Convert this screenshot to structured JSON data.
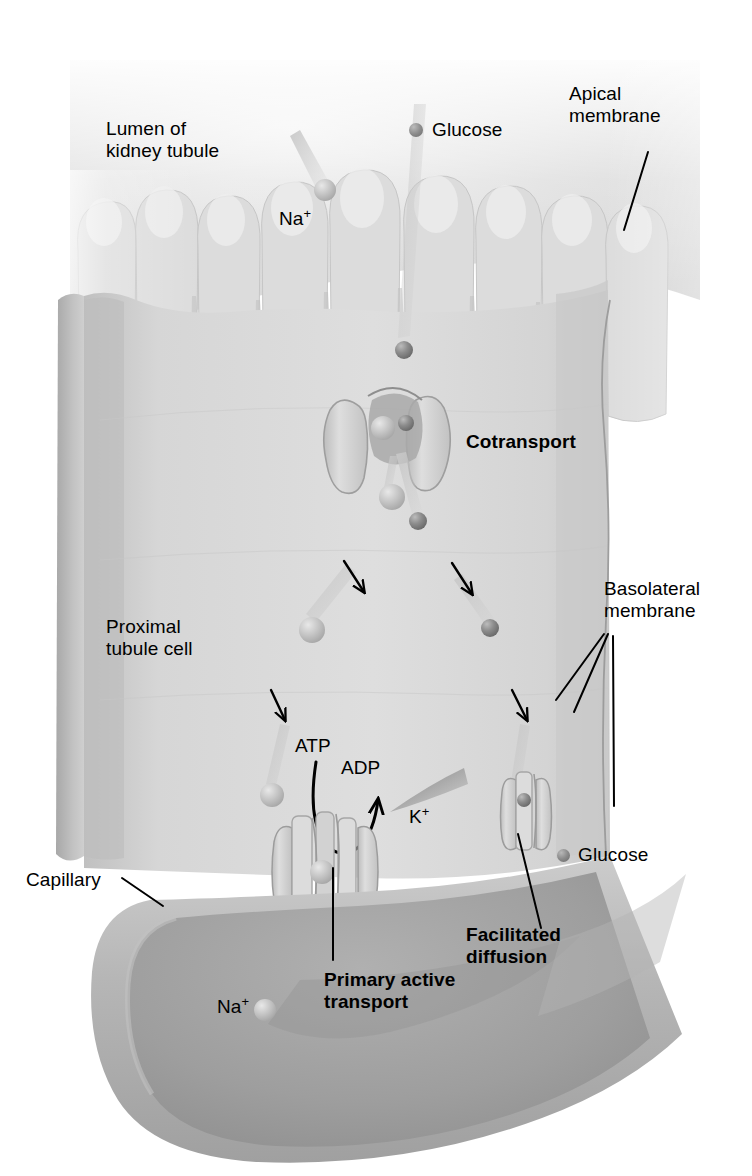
{
  "figure": {
    "domain": "biology-diagram"
  },
  "labels": {
    "lumen": "Lumen of\nkidney tubule",
    "na_lumen": "Na",
    "na_sup": "+",
    "glucose_top": "Glucose",
    "apical_membrane": "Apical\nmembrane",
    "cotransport": "Cotransport",
    "proximal_cell": "Proximal\ntubule cell",
    "basolateral_membrane": "Basolateral\nmembrane",
    "atp": "ATP",
    "adp": "ADP",
    "k_ion": "K",
    "k_sup": "+",
    "capillary": "Capillary",
    "glucose_bottom": "Glucose",
    "facilitated_diffusion": "Facilitated\ndiffusion",
    "primary_active_transport": "Primary active\ntransport",
    "na_capillary": "Na",
    "na_cap_sup": "+"
  },
  "colors": {
    "background": "#ffffff",
    "text": "#000000",
    "lumen_fill": "#d8d8d8",
    "microvilli_fill": "#dcdcdc",
    "cell_fill": "#d2d2d2",
    "cell_face_light": "#dcdcdc",
    "cell_side_dark": "#b4b4b4",
    "capillary_wall": "#b9b9b9",
    "capillary_lumen": "#a2a2a2",
    "protein_fill": "#c8c8c8",
    "na_particle": "#bdbdbd",
    "glucose_particle": "#8a8a8a",
    "arrow_stroke": "#000000",
    "membrane_line": "#9a9a9a"
  },
  "particles": {
    "glucose_marker_top": {
      "x": 416,
      "y": 130,
      "r": 7
    },
    "glucose_marker_bottom": {
      "x": 563,
      "y": 855,
      "r": 6
    },
    "na_in_microvillus": {
      "x": 325,
      "y": 190,
      "r": 11
    },
    "glucose_entering": {
      "x": 404,
      "y": 350,
      "r": 9
    },
    "na_in_cotransporter": {
      "x": 383,
      "y": 428,
      "r": 12
    },
    "glucose_in_cotransporter": {
      "x": 405,
      "y": 423,
      "r": 8
    },
    "na_below_cotransporter": {
      "x": 392,
      "y": 497,
      "r": 13
    },
    "glucose_below_cotransporter": {
      "x": 417,
      "y": 521,
      "r": 9
    },
    "na_midcell": {
      "x": 312,
      "y": 630,
      "r": 13
    },
    "glucose_midcell": {
      "x": 490,
      "y": 628,
      "r": 9
    },
    "na_lower": {
      "x": 272,
      "y": 795,
      "r": 12
    },
    "na_in_pump": {
      "x": 322,
      "y": 872,
      "r": 12
    },
    "na_in_capillary": {
      "x": 265,
      "y": 1010,
      "r": 11
    }
  },
  "arrows": {
    "transport_arrows": [
      {
        "name": "na-down-left-upper",
        "x1": 344,
        "y1": 561,
        "x2": 362,
        "y2": 590
      },
      {
        "name": "glucose-down-right-upper",
        "x1": 452,
        "y1": 563,
        "x2": 470,
        "y2": 592
      },
      {
        "name": "na-down-lower",
        "x1": 272,
        "y1": 690,
        "x2": 284,
        "y2": 718
      },
      {
        "name": "glucose-down-lower",
        "x1": 512,
        "y1": 690,
        "x2": 526,
        "y2": 718
      },
      {
        "name": "na-into-capillary",
        "x1": 294,
        "y1": 940,
        "x2": 308,
        "y2": 968
      }
    ],
    "atp_curve": "ATP hydrolysis curved arrow from ATP to ADP"
  },
  "leaders": {
    "apical": {
      "x1": 645,
      "y1": 155,
      "x2": 625,
      "y2": 228
    },
    "capillary": {
      "x1": 120,
      "y1": 878,
      "x2": 160,
      "y2": 905
    },
    "basolateral_1": {
      "x1": 604,
      "y1": 632,
      "x2": 560,
      "y2": 690
    },
    "basolateral_2": {
      "x1": 606,
      "y1": 632,
      "x2": 572,
      "y2": 700
    },
    "basolateral_3": {
      "x1": 610,
      "y1": 634,
      "x2": 612,
      "y2": 800
    },
    "facilitated": {
      "x1": 540,
      "y1": 930,
      "x2": 516,
      "y2": 830
    },
    "primary_active": {
      "x1": 332,
      "y1": 962,
      "x2": 332,
      "y2": 870
    }
  }
}
